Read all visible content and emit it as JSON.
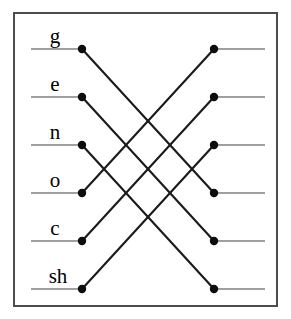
{
  "figure": {
    "width": 291,
    "height": 319,
    "background_color": "#ffffff"
  },
  "frame": {
    "x": 14,
    "y": 13,
    "width": 263,
    "height": 293,
    "stroke_color": "#4d4d4d",
    "fill_color": "#ffffff"
  },
  "colors": {
    "stub_line": "#7f7f7f",
    "cross_line": "#1a1a1a",
    "node": "#0d0d0d",
    "label": "#000000",
    "frame": "#4d4d4d"
  },
  "geometry": {
    "left_node_x": 82,
    "right_node_x": 214,
    "left_stub_start_x": 31,
    "right_stub_end_x": 265,
    "node_radius": 4.2,
    "row_y": [
      49,
      97,
      145,
      193,
      241,
      289
    ]
  },
  "left_nodes": [
    {
      "id": "left-1",
      "label": "g",
      "x": 82,
      "y": 49,
      "label_x": 55,
      "label_y": 43
    },
    {
      "id": "left-2",
      "label": "e",
      "x": 82,
      "y": 97,
      "label_x": 55,
      "label_y": 91
    },
    {
      "id": "left-3",
      "label": "n",
      "x": 82,
      "y": 145,
      "label_x": 55,
      "label_y": 139
    },
    {
      "id": "left-4",
      "label": "o",
      "x": 82,
      "y": 193,
      "label_x": 55,
      "label_y": 187
    },
    {
      "id": "left-5",
      "label": "c",
      "x": 82,
      "y": 241,
      "label_x": 55,
      "label_y": 235
    },
    {
      "id": "left-6",
      "label": "sh",
      "x": 82,
      "y": 289,
      "label_x": 58,
      "label_y": 283
    }
  ],
  "right_nodes": [
    {
      "id": "right-1",
      "label": "",
      "x": 214,
      "y": 49
    },
    {
      "id": "right-2",
      "label": "",
      "x": 214,
      "y": 97
    },
    {
      "id": "right-3",
      "label": "",
      "x": 214,
      "y": 145
    },
    {
      "id": "right-4",
      "label": "",
      "x": 214,
      "y": 193
    },
    {
      "id": "right-5",
      "label": "",
      "x": 214,
      "y": 241
    },
    {
      "id": "right-6",
      "label": "",
      "x": 214,
      "y": 289
    }
  ],
  "connections": [
    {
      "id": "edge-g",
      "from": "left-1",
      "to": "right-4",
      "x1": 82,
      "y1": 49,
      "x2": 214,
      "y2": 193
    },
    {
      "id": "edge-e",
      "from": "left-2",
      "to": "right-5",
      "x1": 82,
      "y1": 97,
      "x2": 214,
      "y2": 241
    },
    {
      "id": "edge-n",
      "from": "left-3",
      "to": "right-6",
      "x1": 82,
      "y1": 145,
      "x2": 214,
      "y2": 289
    },
    {
      "id": "edge-o",
      "from": "left-4",
      "to": "right-1",
      "x1": 82,
      "y1": 193,
      "x2": 214,
      "y2": 49
    },
    {
      "id": "edge-c",
      "from": "left-5",
      "to": "right-2",
      "x1": 82,
      "y1": 241,
      "x2": 214,
      "y2": 97
    },
    {
      "id": "edge-sh",
      "from": "left-6",
      "to": "right-3",
      "x1": 82,
      "y1": 289,
      "x2": 214,
      "y2": 145
    }
  ],
  "left_stubs": [
    {
      "id": "stub-left-1",
      "x1": 31,
      "x2": 82,
      "y": 49
    },
    {
      "id": "stub-left-2",
      "x1": 31,
      "x2": 82,
      "y": 97
    },
    {
      "id": "stub-left-3",
      "x1": 31,
      "x2": 82,
      "y": 145
    },
    {
      "id": "stub-left-4",
      "x1": 31,
      "x2": 82,
      "y": 193
    },
    {
      "id": "stub-left-5",
      "x1": 31,
      "x2": 82,
      "y": 241
    },
    {
      "id": "stub-left-6",
      "x1": 31,
      "x2": 82,
      "y": 289
    }
  ],
  "right_stubs": [
    {
      "id": "stub-right-1",
      "x1": 214,
      "x2": 265,
      "y": 49
    },
    {
      "id": "stub-right-2",
      "x1": 214,
      "x2": 265,
      "y": 97
    },
    {
      "id": "stub-right-3",
      "x1": 214,
      "x2": 265,
      "y": 145
    },
    {
      "id": "stub-right-4",
      "x1": 214,
      "x2": 265,
      "y": 193
    },
    {
      "id": "stub-right-5",
      "x1": 214,
      "x2": 265,
      "y": 241
    },
    {
      "id": "stub-right-6",
      "x1": 214,
      "x2": 265,
      "y": 289
    }
  ]
}
